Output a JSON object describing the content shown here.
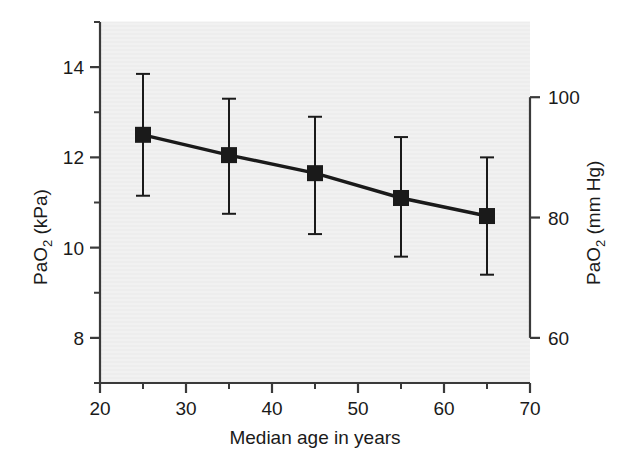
{
  "chart_data": {
    "type": "line",
    "title": "",
    "subtitle": "",
    "xlabel": "Median age in years",
    "ylabel": "PaO2 (kPa)",
    "ylabel_parts": {
      "pre": "PaO",
      "sub": "2",
      "post": " (kPa)"
    },
    "y2label": "PaO2 (mm Hg)",
    "y2label_parts": {
      "pre": "PaO",
      "sub": "2",
      "post": " (mm Hg)"
    },
    "x": [
      25,
      35,
      45,
      55,
      65
    ],
    "xlim": [
      20,
      70
    ],
    "xticks": [
      20,
      30,
      40,
      50,
      60,
      70
    ],
    "xticklabels": [
      "20",
      "30",
      "40",
      "50",
      "60",
      "70"
    ],
    "xminorticks": [
      25,
      35,
      45,
      55,
      65
    ],
    "ylim": [
      7.0,
      15.0
    ],
    "yticks": [
      8,
      10,
      12,
      14
    ],
    "yticklabels": [
      "8",
      "10",
      "12",
      "14"
    ],
    "yminorticks": [
      7,
      9,
      11,
      13,
      15
    ],
    "y2lim": [
      52.5,
      112.5
    ],
    "y2ticks": [
      60,
      80,
      100
    ],
    "y2ticklabels": [
      "60",
      "80",
      "100"
    ],
    "grid": false,
    "legend": "none",
    "marker": "filled-square",
    "series": [
      {
        "name": "PaO2 by median age",
        "values": [
          12.5,
          12.05,
          11.65,
          11.1,
          10.7
        ],
        "err_upper": [
          13.85,
          13.3,
          12.9,
          12.45,
          12.0
        ],
        "err_lower": [
          11.15,
          10.75,
          10.3,
          9.8,
          9.4
        ],
        "color": "#1a1a1a"
      }
    ],
    "plot_background": "#f1f1f1",
    "axis_color": "#3a3a3a"
  },
  "axes": {
    "left_title": "PaO2 (kPa)",
    "right_title": "PaO2 (mm Hg)",
    "bottom_title": "Median age in years"
  }
}
